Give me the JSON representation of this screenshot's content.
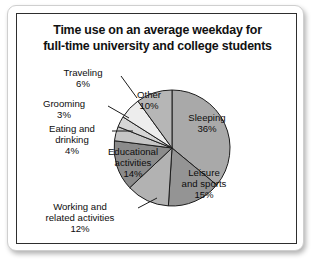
{
  "card": {
    "title_line1": "Time use on an average weekday for",
    "title_line2": "full-time university and college students"
  },
  "chart_data": {
    "type": "pie",
    "title": "Time use on an average weekday for full-time university and college students",
    "xlabel": "",
    "ylabel": "",
    "units": "percent",
    "legend": "none",
    "grid": false,
    "start_angle_deg": 0,
    "direction": "clockwise",
    "center": {
      "cx": 155,
      "cy": 134
    },
    "radius": 58,
    "categories": [
      "Sleeping",
      "Leisure and sports",
      "Working and related activities",
      "Educational activities",
      "Eating and drinking",
      "Grooming",
      "Traveling",
      "Other"
    ],
    "values": [
      36,
      15,
      12,
      14,
      4,
      3,
      6,
      10
    ],
    "slices": [
      {
        "name": "Sleeping",
        "label_line1": "Sleeping",
        "label_line2": "36%",
        "value": 36,
        "color": "#a9a9a9",
        "label_placement": "inside",
        "label_x": 190,
        "label_y": 107
      },
      {
        "name": "Leisure and sports",
        "label_line1": "Leisure",
        "label_line2": "and sports",
        "label_line3": "15%",
        "value": 15,
        "color": "#949494",
        "label_placement": "inside",
        "label_x": 187,
        "label_y": 162
      },
      {
        "name": "Working and related activities",
        "label_line1": "Working and",
        "label_line2": "related activities",
        "label_line3": "12%",
        "value": 12,
        "color": "#b2b2b2",
        "label_placement": "outside",
        "label_x": 63,
        "label_y": 196,
        "leader": {
          "x1": 121,
          "y1": 194,
          "x2": 140,
          "y2": 184
        }
      },
      {
        "name": "Educational activities",
        "label_line1": "Educational",
        "label_line2": "activities",
        "label_line3": "14%",
        "value": 14,
        "color": "#8b8b8b",
        "label_placement": "inside",
        "label_x": 116,
        "label_y": 141
      },
      {
        "name": "Eating and drinking",
        "label_line1": "Eating and",
        "label_line2": "drinking",
        "label_line3": "4%",
        "value": 4,
        "color": "#c6c6c6",
        "label_placement": "outside",
        "label_x": 55,
        "label_y": 118,
        "leader": {
          "x1": 95,
          "y1": 117,
          "x2": 116,
          "y2": 117
        }
      },
      {
        "name": "Grooming",
        "label_line1": "Grooming",
        "label_line2": "3%",
        "value": 3,
        "color": "#d6d6d6",
        "label_placement": "outside",
        "label_x": 47,
        "label_y": 93,
        "leader": {
          "x1": 91,
          "y1": 92,
          "x2": 112,
          "y2": 104
        }
      },
      {
        "name": "Traveling",
        "label_line1": "Traveling",
        "label_line2": "6%",
        "value": 6,
        "color": "#ededed",
        "label_placement": "outside",
        "label_x": 66,
        "label_y": 62,
        "leader": {
          "x1": 104,
          "y1": 62,
          "x2": 120,
          "y2": 84
        }
      },
      {
        "name": "Other",
        "label_line1": "Other",
        "label_line2": "10%",
        "value": 10,
        "color": "#b6b6b6",
        "label_placement": "inside",
        "label_x": 132,
        "label_y": 84
      }
    ]
  }
}
